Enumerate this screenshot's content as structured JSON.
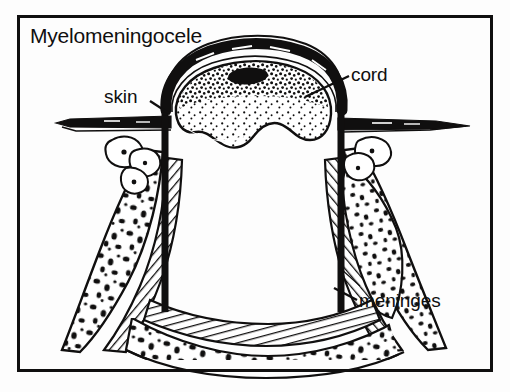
{
  "figure": {
    "kind": "medical-line-illustration",
    "title": "Myelomeningocele",
    "background_color": "#fdfdfd",
    "ink_color": "#100f0f",
    "frame": {
      "name": "outer-border",
      "x": 17,
      "y": 15,
      "width": 476,
      "height": 357,
      "stroke_color": "#100f0f",
      "stroke_width": 3
    },
    "labels": [
      {
        "id": "title",
        "text": "Myelomeningocele",
        "x": 30,
        "y": 24,
        "font_size": 21,
        "has_leader_line": false
      },
      {
        "id": "skin",
        "text": "skin",
        "x": 104,
        "y": 86,
        "font_size": 19,
        "has_leader_line": true,
        "leader_points": "150,100 168,112"
      },
      {
        "id": "cord",
        "text": "cord",
        "x": 351,
        "y": 64,
        "font_size": 19,
        "has_leader_line": true,
        "leader_points": "349,76 306,97"
      },
      {
        "id": "meninges",
        "text": "meninges",
        "x": 359,
        "y": 290,
        "font_size": 19,
        "has_leader_line": true,
        "leader_points": "357,300 336,289"
      }
    ],
    "anatomy": [
      {
        "id": "sac-membrane",
        "name": "meningeal-sac",
        "description": "Thick black dome enclosing protruding sac above the skin line"
      },
      {
        "id": "neural-placode",
        "name": "spinal-cord-placode",
        "description": "Stippled neural tissue inside the top of the sac"
      },
      {
        "id": "central-canal",
        "name": "central-canal",
        "description": "Solid black oval within the neural placode"
      },
      {
        "id": "skin-left",
        "name": "skin-surface-left",
        "description": "Thick horizontal skin line running left from the sac base"
      },
      {
        "id": "skin-right",
        "name": "skin-surface-right",
        "description": "Thick horizontal skin line tapering right from the sac base"
      },
      {
        "id": "vertebra-left",
        "name": "vertebral-bone-left",
        "description": "Speckled cancellous bone of the split vertebral arch, left side"
      },
      {
        "id": "vertebra-right",
        "name": "vertebral-bone-right",
        "description": "Speckled cancellous bone of the split vertebral arch, right side"
      },
      {
        "id": "vertebral-body",
        "name": "vertebral-body",
        "description": "Speckled bone band forming the floor of the spinal canal"
      },
      {
        "id": "dura-hatching",
        "name": "dura-meninges-lining",
        "description": "Hatched band lining the spinal canal representing the meninges"
      }
    ]
  }
}
